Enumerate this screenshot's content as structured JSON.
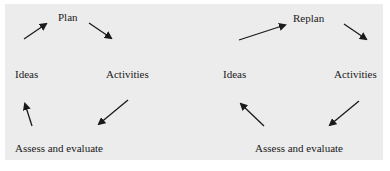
{
  "diagram": {
    "left_cycle": {
      "nodes": [
        "Plan",
        "Activities",
        "Assess and evaluate",
        "Ideas"
      ],
      "edges": [
        {
          "from": "Ideas",
          "to": "Plan"
        },
        {
          "from": "Plan",
          "to": "Activities"
        },
        {
          "from": "Activities",
          "to": "Assess and evaluate"
        },
        {
          "from": "Assess and evaluate",
          "to": "Ideas"
        }
      ]
    },
    "right_cycle": {
      "nodes": [
        "Replan",
        "Activities",
        "Assess and evaluate",
        "Ideas"
      ],
      "edges": [
        {
          "from": "Ideas",
          "to": "Replan"
        },
        {
          "from": "Replan",
          "to": "Activities"
        },
        {
          "from": "Activities",
          "to": "Assess and evaluate"
        },
        {
          "from": "Assess and evaluate",
          "to": "Ideas"
        }
      ]
    },
    "colors": {
      "background": "#ececec",
      "ink": "#1a1a1a"
    }
  },
  "labels": {
    "left": {
      "plan": "Plan",
      "activities": "Activities",
      "assess": "Assess and evaluate",
      "ideas": "Ideas"
    },
    "right": {
      "plan": "Replan",
      "activities": "Activities",
      "assess": "Assess and evaluate",
      "ideas": "Ideas"
    }
  }
}
